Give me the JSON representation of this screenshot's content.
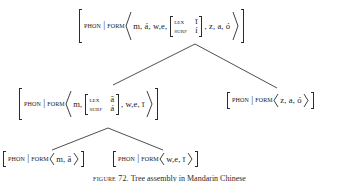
{
  "figure": {
    "type": "linguistic-feature-structure-tree",
    "caption_label": "FIGURE 72.",
    "caption_text": "Tree assembly in Mandarin Chinese"
  },
  "labels": {
    "phon": "PHON",
    "separator": "|",
    "form": "FORM",
    "lex": "LEX",
    "surf": "SURF"
  },
  "nodes": {
    "root": {
      "id": "root-node",
      "phon": "PHON",
      "form": "FORM",
      "seq_before": "m, á, w,e,",
      "matrix": {
        "lex_attr": "LEX",
        "lex_value": "ī",
        "surf_attr": "SURF",
        "surf_value": "í"
      },
      "seq_after": ", z, a, ó"
    },
    "mid_left": {
      "id": "mid-left-node",
      "phon": "PHON",
      "form": "FORM",
      "seq_before": "m,",
      "matrix": {
        "lex_attr": "LEX",
        "lex_value": "ā",
        "surf_attr": "SURF",
        "surf_value": "á"
      },
      "seq_after": ", w,e, ī"
    },
    "mid_right": {
      "id": "mid-right-node",
      "phon": "PHON",
      "form": "FORM",
      "seq": "z, a, ó"
    },
    "leaf_left": {
      "id": "leaf-left-node",
      "phon": "PHON",
      "form": "FORM",
      "seq": "m, ā"
    },
    "leaf_right": {
      "id": "leaf-right-node",
      "phon": "PHON",
      "form": "FORM",
      "seq": "w,e, ī"
    }
  },
  "edges": [
    {
      "name": "root-to-mid-left",
      "from": [
        195,
        44
      ],
      "to": [
        113,
        85
      ]
    },
    {
      "name": "root-to-mid-right",
      "from": [
        195,
        44
      ],
      "to": [
        277,
        88
      ]
    },
    {
      "name": "mid-left-to-leaf-left",
      "from": [
        108,
        128
      ],
      "to": [
        52,
        150
      ]
    },
    {
      "name": "mid-left-to-leaf-right",
      "from": [
        108,
        128
      ],
      "to": [
        163,
        150
      ]
    }
  ],
  "colors": {
    "ink": "#2b2b2b",
    "background": "#ffffff",
    "line": "#3a3a3a"
  }
}
